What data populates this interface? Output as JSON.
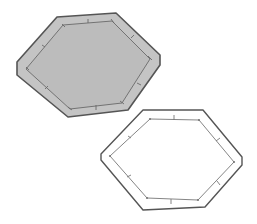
{
  "diagram": {
    "colors": {
      "background": "#ffffff",
      "outline": "#555555",
      "filled_top": "#c4c4c4",
      "inner_fill_top": "#bdbdbd",
      "inner_line": "#6a6a6a",
      "unfilled_bottom": "#ffffff"
    },
    "shapes": [
      {
        "name": "filled-hexagon-frame",
        "outer": "57,17 116,13 160,55 160,65 128,110 68,117 17,75 17,62",
        "inner": "63,25 112,21 150,59 122,103 70,109 26,69"
      },
      {
        "name": "outline-hexagon-frame",
        "outer": "143,110 203,110 242,157 242,165 205,207 143,210 101,160 101,154",
        "inner": "150,119 199,120 234,162 198,200 147,198 110,156"
      }
    ]
  }
}
